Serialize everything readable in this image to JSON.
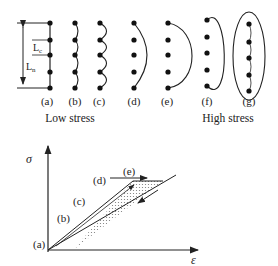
{
  "top_panel": {
    "dimension_labels": {
      "lc": "L",
      "lc_sub": "c",
      "ln": "L",
      "ln_sub": "n"
    },
    "column_labels": [
      "(a)",
      "(b)",
      "(c)",
      "(d)",
      "(e)",
      "(f)",
      "(g)"
    ],
    "group_labels": {
      "low": "Low stress",
      "high": "High stress"
    }
  },
  "bottom_panel": {
    "y_axis_label": "σ",
    "x_axis_label": "ε",
    "point_labels": [
      "(a)",
      "(b)",
      "(c)",
      "(d)",
      "(e)"
    ]
  },
  "colors": {
    "ink": "#222222",
    "shade": "#cccccc"
  }
}
